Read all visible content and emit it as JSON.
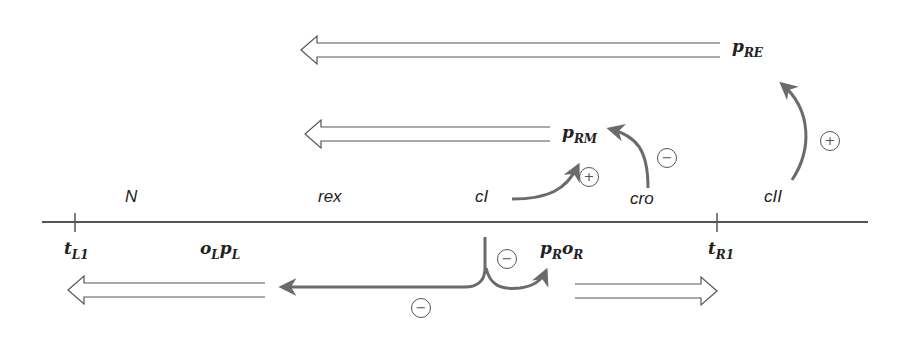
{
  "diagram": {
    "title": "",
    "colors": {
      "line": "#555555",
      "regulation_arrow": "#6b6b6b",
      "text": "#222222"
    },
    "genes": [
      {
        "id": "N",
        "label": "N"
      },
      {
        "id": "rex",
        "label": "rex"
      },
      {
        "id": "cI",
        "label": "cI"
      },
      {
        "id": "cro",
        "label": "cro"
      },
      {
        "id": "cII",
        "label": "cII"
      }
    ],
    "terminators": [
      {
        "id": "tL1",
        "main": "t",
        "sub": "L1"
      },
      {
        "id": "tR1",
        "main": "t",
        "sub": "R1"
      }
    ],
    "promoters": {
      "pRE": {
        "main": "p",
        "sub": "RE"
      },
      "pRM": {
        "main": "p",
        "sub": "RM"
      },
      "oLpL": {
        "o": "o",
        "o_sub": "L",
        "p": "p",
        "p_sub": "L"
      },
      "pRoR": {
        "p": "p",
        "p_sub": "R",
        "o": "o",
        "o_sub": "R"
      }
    },
    "transcripts": [
      {
        "from": "pRE",
        "direction": "leftward"
      },
      {
        "from": "pRM",
        "direction": "leftward"
      },
      {
        "from": "pL",
        "direction": "leftward"
      },
      {
        "from": "pR",
        "direction": "rightward"
      }
    ],
    "regulation": [
      {
        "from": "cI",
        "to": "pRM",
        "sign": "+"
      },
      {
        "from": "cro",
        "to": "pRM",
        "sign": "−"
      },
      {
        "from": "cII",
        "to": "pRE",
        "sign": "+"
      },
      {
        "from": "cI",
        "to": "pL",
        "sign": "−"
      },
      {
        "from": "cI",
        "to": "pR",
        "sign": "−"
      }
    ],
    "signs": {
      "plus": "+",
      "minus": "−"
    }
  }
}
